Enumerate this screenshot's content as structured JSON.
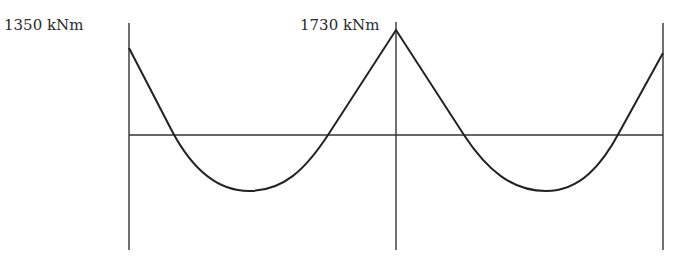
{
  "diagram": {
    "type": "bending-moment-diagram",
    "labels": {
      "left_support_moment": "1350 kNm",
      "middle_support_moment": "1730 kNm"
    },
    "colors": {
      "line": "#2a2a2a",
      "background": "#ffffff"
    }
  }
}
